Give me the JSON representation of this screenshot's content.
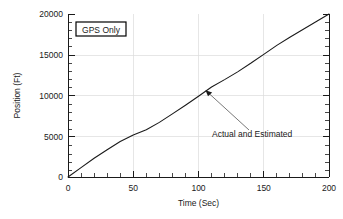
{
  "chart_data": {
    "type": "line",
    "title": "",
    "xlabel": "Time (Sec)",
    "ylabel": "Position (Ft)",
    "xlim": [
      0,
      200
    ],
    "ylim": [
      0,
      20000
    ],
    "xticks": [
      0,
      50,
      100,
      150,
      200
    ],
    "xtick_labels": [
      "0",
      "50",
      "100",
      "150",
      "200"
    ],
    "yticks": [
      0,
      5000,
      10000,
      15000,
      20000
    ],
    "ytick_labels": [
      "0",
      "5000",
      "10000",
      "15000",
      "20000"
    ],
    "x_minor_step": 10,
    "y_minor_step": 1000,
    "grid": true,
    "grid_color": "#dcdcdc",
    "legend_position": "upper-left",
    "series": [
      {
        "name": "Actual and Estimated",
        "color": "#1a1a1a",
        "x": [
          0,
          10,
          20,
          30,
          40,
          50,
          60,
          70,
          80,
          90,
          100,
          110,
          120,
          130,
          140,
          150,
          160,
          170,
          180,
          190,
          200
        ],
        "values": [
          0,
          1150,
          2300,
          3350,
          4350,
          5150,
          5800,
          6700,
          7750,
          8800,
          9900,
          11050,
          11950,
          12900,
          13950,
          15050,
          16150,
          17150,
          18100,
          19050,
          20000
        ]
      }
    ],
    "legend_entries": [
      {
        "label": "GPS Only",
        "boxed": true
      }
    ],
    "annotations": [
      {
        "text": "Actual and Estimated",
        "target_x": 112,
        "target_y": 11300,
        "label_x": 150,
        "label_y": 3200
      }
    ]
  },
  "legend": {
    "gps_only_label": "GPS Only"
  },
  "axes": {
    "x_title": "Time (Sec)",
    "y_title": "Position (Ft)",
    "x_labels": [
      "0",
      "50",
      "100",
      "150",
      "200"
    ],
    "y_labels": [
      "0",
      "5000",
      "10000",
      "15000",
      "20000"
    ]
  },
  "annotation": {
    "text": "Actual and Estimated"
  }
}
